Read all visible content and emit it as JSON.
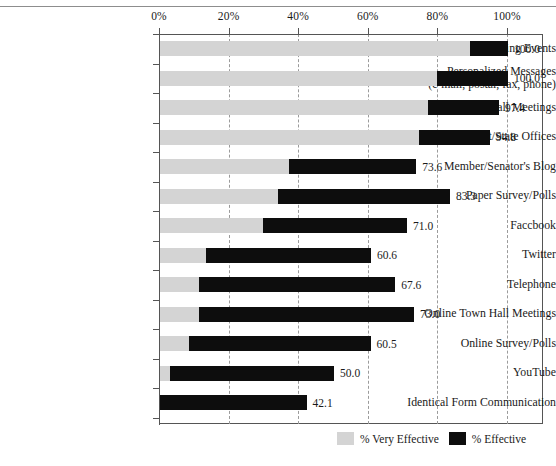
{
  "chart_data": {
    "type": "bar",
    "orientation": "horizontal",
    "stacked": true,
    "title": "",
    "xlabel": "",
    "ylabel": "",
    "xlim": [
      0,
      100
    ],
    "xticks": [
      "0%",
      "20%",
      "40%",
      "60%",
      "80%",
      "100%"
    ],
    "xtick_values": [
      0,
      20,
      40,
      60,
      80,
      100
    ],
    "grid": "vertical-dashed",
    "legend_position": "bottom-right",
    "legend": [
      "% Very Effective",
      "% Effective"
    ],
    "series": [
      {
        "name": "% Very Effective",
        "color": "#d4d4d4",
        "values": [
          89.0,
          79.5,
          77.0,
          74.4,
          37.0,
          34.0,
          29.5,
          13.2,
          11.2,
          11.2,
          8.3,
          3.0,
          0.0
        ]
      },
      {
        "name": "% Effective",
        "color": "#0d0d0d",
        "values": [
          11.0,
          20.5,
          20.4,
          20.4,
          36.6,
          49.3,
          41.5,
          47.4,
          56.4,
          61.8,
          52.2,
          47.0,
          42.1
        ]
      }
    ],
    "categories": [
      "Attending Events",
      "Personalized Messages\n(e-mail, postal, fax, phone)",
      "Town Hall Meetings",
      "District/State Offices",
      "Member/Senator's Blog",
      "Paper Survey/Polls",
      "Faccbook",
      "Twitter",
      "Telephone",
      "Online Town Hall Meetings",
      "Online Survey/Polls",
      "YouTube",
      "Identical Form Communication"
    ],
    "totals": [
      100.0,
      100.0,
      97.4,
      94.8,
      73.6,
      83.3,
      71.0,
      60.6,
      67.6,
      73.0,
      60.5,
      50.0,
      42.1
    ],
    "total_labels": [
      "100.0",
      "100.0",
      "97.4",
      "94.8",
      "73.6",
      "83.3",
      "71.0",
      "60.6",
      "67.6",
      "73.0",
      "60.5",
      "50.0",
      "42.1"
    ]
  },
  "colors": {
    "very_effective": "#d4d4d4",
    "effective": "#0d0d0d",
    "axis": "#555555",
    "grid": "#9b9b9b",
    "text": "#1a1a1a"
  }
}
